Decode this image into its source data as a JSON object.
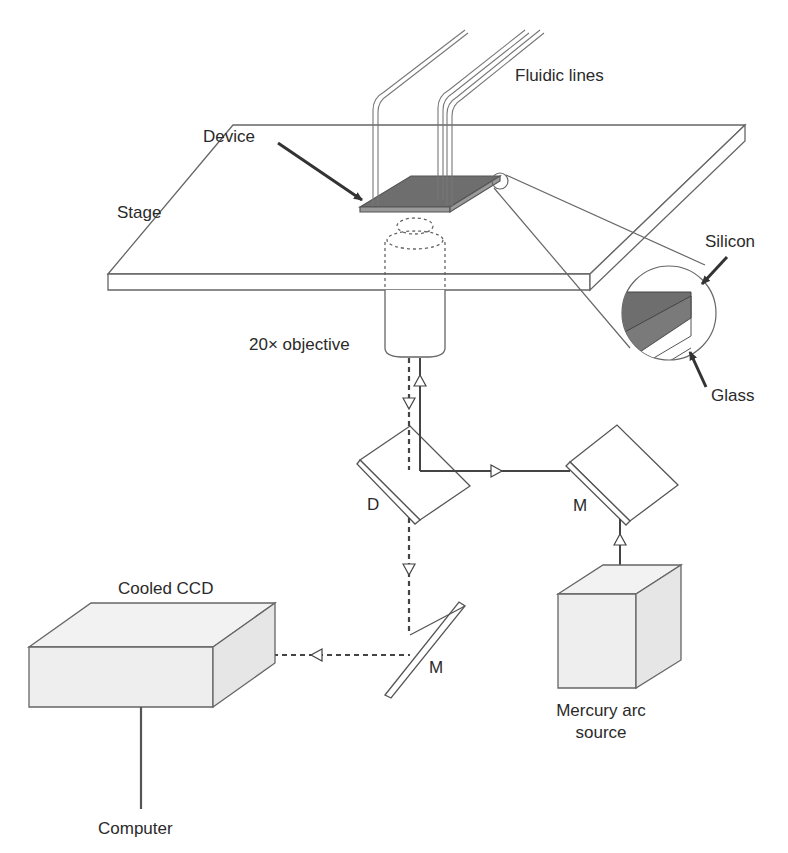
{
  "diagram": {
    "type": "optical-setup-schematic",
    "labels": {
      "fluidic_lines": "Fluidic lines",
      "device": "Device",
      "stage": "Stage",
      "silicon": "Silicon",
      "glass": "Glass",
      "objective": "20× objective",
      "dichroic": "D",
      "mirror_right": "M",
      "mirror_bottom": "M",
      "cooled_ccd": "Cooled CCD",
      "mercury_source_line1": "Mercury arc",
      "mercury_source_line2": "source",
      "computer": "Computer"
    },
    "colors": {
      "line": "#555555",
      "device_fill": "#6e6e6e",
      "box_fill": "#efefef",
      "text": "#2a2a2a"
    },
    "components": [
      {
        "id": "fluidic-lines",
        "label_key": "fluidic_lines"
      },
      {
        "id": "device",
        "label_key": "device"
      },
      {
        "id": "stage",
        "label_key": "stage"
      },
      {
        "id": "inset-cross-section",
        "layers": [
          "silicon",
          "glass"
        ]
      },
      {
        "id": "objective",
        "label_key": "objective"
      },
      {
        "id": "dichroic-mirror",
        "label_key": "dichroic"
      },
      {
        "id": "mirror-right",
        "label_key": "mirror_right"
      },
      {
        "id": "mirror-bottom",
        "label_key": "mirror_bottom"
      },
      {
        "id": "mercury-arc-source",
        "label_key": "mercury_source_line1"
      },
      {
        "id": "cooled-ccd",
        "label_key": "cooled_ccd"
      },
      {
        "id": "computer",
        "label_key": "computer"
      }
    ],
    "light_paths": [
      {
        "name": "excitation",
        "style": "solid",
        "from": "mercury-arc-source",
        "via": [
          "mirror-right",
          "dichroic-mirror"
        ],
        "to": "objective"
      },
      {
        "name": "emission",
        "style": "dashed",
        "from": "objective",
        "via": [
          "dichroic-mirror",
          "mirror-bottom"
        ],
        "to": "cooled-ccd"
      }
    ]
  }
}
